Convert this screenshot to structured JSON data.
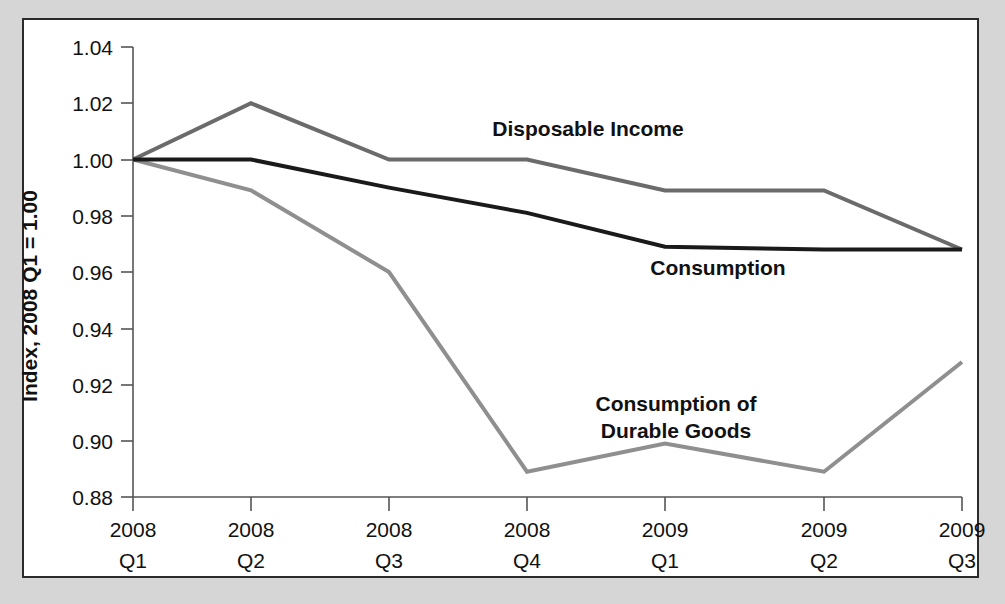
{
  "figure": {
    "background_color": "#d6d6d6",
    "plot_background_color": "#ffffff",
    "frame_color": "#2b2b2b"
  },
  "chart_data": {
    "type": "line",
    "title": "",
    "subtitle": "",
    "xlabel": "",
    "ylabel": "Index, 2008 Q1 = 1.00",
    "grid": false,
    "legend_position": "inline-annotations",
    "ylim": [
      0.88,
      1.04
    ],
    "ytick_labels": [
      "1.04",
      "1.02",
      "1.00",
      "0.98",
      "0.96",
      "0.94",
      "0.92",
      "0.90",
      "0.88"
    ],
    "ytick_values": [
      1.04,
      1.02,
      1.0,
      0.98,
      0.96,
      0.94,
      0.92,
      0.9,
      0.88
    ],
    "categories": [
      "2008 Q1",
      "2008 Q2",
      "2008 Q3",
      "2008 Q4",
      "2009 Q1",
      "2009 Q2",
      "2009 Q3"
    ],
    "xtick_labels": [
      {
        "year": "2008",
        "quarter": "Q1"
      },
      {
        "year": "2008",
        "quarter": "Q2"
      },
      {
        "year": "2008",
        "quarter": "Q3"
      },
      {
        "year": "2008",
        "quarter": "Q4"
      },
      {
        "year": "2009",
        "quarter": "Q1"
      },
      {
        "year": "2009",
        "quarter": "Q2"
      },
      {
        "year": "2009",
        "quarter": "Q3"
      }
    ],
    "series": [
      {
        "name": "Disposable Income",
        "color": "#6b6b6b",
        "line_width": 4,
        "values": [
          1.0,
          1.02,
          1.0,
          1.0,
          0.989,
          0.989,
          0.968
        ]
      },
      {
        "name": "Consumption",
        "color": "#1a1a1a",
        "line_width": 4,
        "values": [
          1.0,
          1.0,
          0.99,
          0.981,
          0.969,
          0.968,
          0.968
        ]
      },
      {
        "name": "Consumption of Durable Goods",
        "color": "#8f8f8f",
        "line_width": 4,
        "values": [
          1.0,
          0.989,
          0.96,
          0.889,
          0.899,
          0.889,
          0.928
        ]
      }
    ],
    "annotations": [
      {
        "text": "Disposable Income",
        "series": "Disposable Income",
        "x": 588,
        "y": 136
      },
      {
        "text": "Consumption",
        "series": "Consumption",
        "x": 718,
        "y": 275
      },
      {
        "text": "Consumption of",
        "series": "Consumption of Durable Goods",
        "x": 676,
        "y": 411
      },
      {
        "text": "Durable Goods",
        "series": "Consumption of Durable Goods",
        "x": 676,
        "y": 438
      }
    ]
  }
}
